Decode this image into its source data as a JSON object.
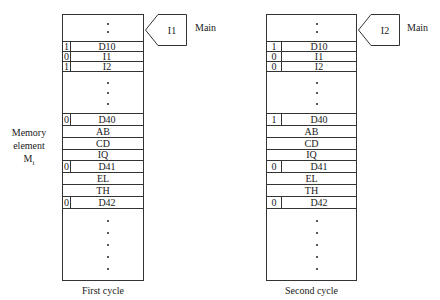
{
  "side_label": {
    "line1": "Memory",
    "line2": "element",
    "line3": "M",
    "subscript": "i"
  },
  "pointer_target": "Main",
  "panels": [
    {
      "caption": "First cycle",
      "pointer": "I1",
      "rows": [
        {
          "flag": "1",
          "label": "D10"
        },
        {
          "flag": "0",
          "label": "I1"
        },
        {
          "flag": "1",
          "label": "I2"
        },
        {
          "flag": "0",
          "label": "D40"
        },
        {
          "flag": "",
          "label": "AB"
        },
        {
          "flag": "",
          "label": "CD"
        },
        {
          "flag": "",
          "label": "IQ"
        },
        {
          "flag": "0",
          "label": "D41"
        },
        {
          "flag": "",
          "label": "EL"
        },
        {
          "flag": "",
          "label": "TH"
        },
        {
          "flag": "0",
          "label": "D42"
        }
      ]
    },
    {
      "caption": "Second cycle",
      "pointer": "I2",
      "rows": [
        {
          "flag": "1",
          "label": "D10"
        },
        {
          "flag": "0",
          "label": "I1"
        },
        {
          "flag": "0",
          "label": "I2"
        },
        {
          "flag": "1",
          "label": "D40"
        },
        {
          "flag": "",
          "label": "AB"
        },
        {
          "flag": "",
          "label": "CD"
        },
        {
          "flag": "",
          "label": "IQ"
        },
        {
          "flag": "0",
          "label": "D41"
        },
        {
          "flag": "",
          "label": "EL"
        },
        {
          "flag": "",
          "label": "TH"
        },
        {
          "flag": "0",
          "label": "D42"
        }
      ]
    }
  ]
}
